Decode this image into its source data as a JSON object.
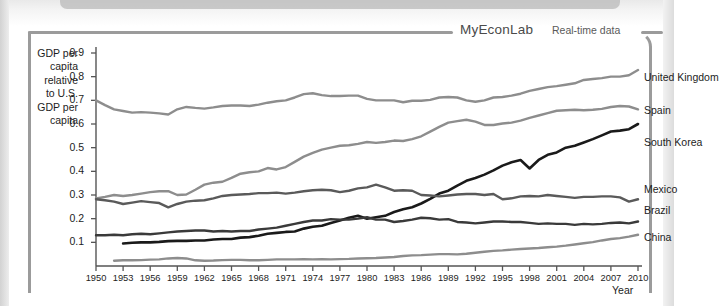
{
  "banner": {
    "brand": "MyEconLab",
    "subtitle": "Real-time data"
  },
  "chart_data": {
    "type": "line",
    "title": "",
    "xlabel": "Year",
    "ylabel": "GDP per capita relative to U.S. GDP per capita",
    "ylabel_lines": [
      "GDP per",
      "capita",
      "relative",
      "to U.S.",
      "GDP per",
      "capita"
    ],
    "xlim": [
      1950,
      2010
    ],
    "ylim": [
      0,
      0.9
    ],
    "grid": false,
    "legend_position": "right-inline",
    "ytick_labels": [
      "0.9",
      "0.8",
      "0.7",
      "0.6",
      "0.5",
      "0.4",
      "0.3",
      "0.2",
      "0.1"
    ],
    "yticks": [
      0.9,
      0.8,
      0.7,
      0.6,
      0.5,
      0.4,
      0.3,
      0.2,
      0.1
    ],
    "xtick_labels": [
      "1950",
      "1953",
      "1956",
      "1959",
      "1962",
      "1965",
      "1968",
      "1971",
      "1974",
      "1977",
      "1980",
      "1983",
      "1986",
      "1989",
      "1992",
      "1995",
      "1998",
      "2001",
      "2004",
      "2007",
      "2010"
    ],
    "xticks": [
      1950,
      1953,
      1956,
      1959,
      1962,
      1965,
      1968,
      1971,
      1974,
      1977,
      1980,
      1983,
      1986,
      1989,
      1992,
      1995,
      1998,
      2001,
      2004,
      2007,
      2010
    ],
    "series": [
      {
        "name": "United Kingdom",
        "color": "#8d8d8d",
        "width": 2.4,
        "label_y": 0.795,
        "x": [
          1950,
          1951,
          1952,
          1953,
          1954,
          1955,
          1956,
          1957,
          1958,
          1959,
          1960,
          1961,
          1962,
          1963,
          1964,
          1965,
          1966,
          1967,
          1968,
          1969,
          1970,
          1971,
          1972,
          1973,
          1974,
          1975,
          1976,
          1977,
          1978,
          1979,
          1980,
          1981,
          1982,
          1983,
          1984,
          1985,
          1986,
          1987,
          1988,
          1989,
          1990,
          1991,
          1992,
          1993,
          1994,
          1995,
          1996,
          1997,
          1998,
          1999,
          2000,
          2001,
          2002,
          2003,
          2004,
          2005,
          2006,
          2007,
          2008,
          2009,
          2010
        ],
        "values": [
          0.7,
          0.68,
          0.662,
          0.655,
          0.648,
          0.65,
          0.648,
          0.645,
          0.64,
          0.662,
          0.672,
          0.668,
          0.665,
          0.67,
          0.676,
          0.678,
          0.678,
          0.676,
          0.682,
          0.69,
          0.696,
          0.7,
          0.712,
          0.726,
          0.73,
          0.722,
          0.718,
          0.718,
          0.72,
          0.72,
          0.706,
          0.7,
          0.7,
          0.7,
          0.692,
          0.698,
          0.698,
          0.702,
          0.712,
          0.714,
          0.712,
          0.7,
          0.694,
          0.7,
          0.712,
          0.714,
          0.72,
          0.728,
          0.74,
          0.748,
          0.756,
          0.76,
          0.766,
          0.772,
          0.786,
          0.79,
          0.794,
          0.8,
          0.8,
          0.806,
          0.828
        ]
      },
      {
        "name": "Spain",
        "color": "#8d8d8d",
        "width": 2.4,
        "label_y": 0.655,
        "x": [
          1950,
          1951,
          1952,
          1953,
          1954,
          1955,
          1956,
          1957,
          1958,
          1959,
          1960,
          1961,
          1962,
          1963,
          1964,
          1965,
          1966,
          1967,
          1968,
          1969,
          1970,
          1971,
          1972,
          1973,
          1974,
          1975,
          1976,
          1977,
          1978,
          1979,
          1980,
          1981,
          1982,
          1983,
          1984,
          1985,
          1986,
          1987,
          1988,
          1989,
          1990,
          1991,
          1992,
          1993,
          1994,
          1995,
          1996,
          1997,
          1998,
          1999,
          2000,
          2001,
          2002,
          2003,
          2004,
          2005,
          2006,
          2007,
          2008,
          2009,
          2010
        ],
        "values": [
          0.285,
          0.292,
          0.3,
          0.296,
          0.3,
          0.306,
          0.312,
          0.316,
          0.316,
          0.3,
          0.302,
          0.322,
          0.344,
          0.352,
          0.356,
          0.372,
          0.39,
          0.396,
          0.4,
          0.414,
          0.408,
          0.418,
          0.44,
          0.462,
          0.478,
          0.492,
          0.5,
          0.508,
          0.51,
          0.516,
          0.524,
          0.52,
          0.524,
          0.53,
          0.528,
          0.536,
          0.548,
          0.568,
          0.588,
          0.606,
          0.612,
          0.618,
          0.61,
          0.596,
          0.596,
          0.602,
          0.606,
          0.614,
          0.626,
          0.636,
          0.646,
          0.656,
          0.658,
          0.66,
          0.658,
          0.66,
          0.664,
          0.672,
          0.676,
          0.674,
          0.662
        ]
      },
      {
        "name": "South Korea",
        "color": "#1a1a1a",
        "width": 2.6,
        "label_y": 0.52,
        "x": [
          1953,
          1954,
          1955,
          1956,
          1957,
          1958,
          1959,
          1960,
          1961,
          1962,
          1963,
          1964,
          1965,
          1966,
          1967,
          1968,
          1969,
          1970,
          1971,
          1972,
          1973,
          1974,
          1975,
          1976,
          1977,
          1978,
          1979,
          1980,
          1981,
          1982,
          1983,
          1984,
          1985,
          1986,
          1987,
          1988,
          1989,
          1990,
          1991,
          1992,
          1993,
          1994,
          1995,
          1996,
          1997,
          1998,
          1999,
          2000,
          2001,
          2002,
          2003,
          2004,
          2005,
          2006,
          2007,
          2008,
          2009,
          2010
        ],
        "values": [
          0.095,
          0.098,
          0.1,
          0.1,
          0.102,
          0.105,
          0.106,
          0.106,
          0.108,
          0.108,
          0.112,
          0.114,
          0.114,
          0.12,
          0.122,
          0.128,
          0.136,
          0.14,
          0.144,
          0.146,
          0.158,
          0.166,
          0.17,
          0.182,
          0.192,
          0.204,
          0.212,
          0.2,
          0.206,
          0.212,
          0.228,
          0.24,
          0.248,
          0.264,
          0.284,
          0.306,
          0.318,
          0.34,
          0.36,
          0.372,
          0.386,
          0.404,
          0.424,
          0.438,
          0.448,
          0.412,
          0.448,
          0.47,
          0.48,
          0.5,
          0.508,
          0.522,
          0.536,
          0.552,
          0.568,
          0.572,
          0.578,
          0.6
        ]
      },
      {
        "name": "Mexico",
        "color": "#5a5a5a",
        "width": 2.4,
        "label_y": 0.32,
        "x": [
          1950,
          1951,
          1952,
          1953,
          1954,
          1955,
          1956,
          1957,
          1958,
          1959,
          1960,
          1961,
          1962,
          1963,
          1964,
          1965,
          1966,
          1967,
          1968,
          1969,
          1970,
          1971,
          1972,
          1973,
          1974,
          1975,
          1976,
          1977,
          1978,
          1979,
          1980,
          1981,
          1982,
          1983,
          1984,
          1985,
          1986,
          1987,
          1988,
          1989,
          1990,
          1991,
          1992,
          1993,
          1994,
          1995,
          1996,
          1997,
          1998,
          1999,
          2000,
          2001,
          2002,
          2003,
          2004,
          2005,
          2006,
          2007,
          2008,
          2009,
          2010
        ],
        "values": [
          0.282,
          0.278,
          0.272,
          0.262,
          0.268,
          0.274,
          0.27,
          0.266,
          0.248,
          0.262,
          0.272,
          0.276,
          0.278,
          0.286,
          0.296,
          0.3,
          0.302,
          0.304,
          0.308,
          0.308,
          0.31,
          0.306,
          0.31,
          0.316,
          0.32,
          0.322,
          0.32,
          0.312,
          0.318,
          0.328,
          0.332,
          0.344,
          0.332,
          0.318,
          0.32,
          0.318,
          0.3,
          0.298,
          0.294,
          0.298,
          0.302,
          0.304,
          0.304,
          0.3,
          0.304,
          0.282,
          0.286,
          0.294,
          0.296,
          0.294,
          0.3,
          0.296,
          0.292,
          0.288,
          0.292,
          0.292,
          0.294,
          0.294,
          0.29,
          0.272,
          0.282
        ]
      },
      {
        "name": "Brazil",
        "color": "#3a3a3a",
        "width": 2.4,
        "label_y": 0.232,
        "x": [
          1950,
          1951,
          1952,
          1953,
          1954,
          1955,
          1956,
          1957,
          1958,
          1959,
          1960,
          1961,
          1962,
          1963,
          1964,
          1965,
          1966,
          1967,
          1968,
          1969,
          1970,
          1971,
          1972,
          1973,
          1974,
          1975,
          1976,
          1977,
          1978,
          1979,
          1980,
          1981,
          1982,
          1983,
          1984,
          1985,
          1986,
          1987,
          1988,
          1989,
          1990,
          1991,
          1992,
          1993,
          1994,
          1995,
          1996,
          1997,
          1998,
          1999,
          2000,
          2001,
          2002,
          2003,
          2004,
          2005,
          2006,
          2007,
          2008,
          2009,
          2010
        ],
        "values": [
          0.13,
          0.13,
          0.132,
          0.13,
          0.134,
          0.136,
          0.134,
          0.138,
          0.142,
          0.146,
          0.148,
          0.15,
          0.15,
          0.146,
          0.148,
          0.146,
          0.148,
          0.148,
          0.154,
          0.158,
          0.162,
          0.17,
          0.178,
          0.186,
          0.192,
          0.192,
          0.198,
          0.196,
          0.196,
          0.2,
          0.206,
          0.196,
          0.196,
          0.186,
          0.19,
          0.196,
          0.204,
          0.202,
          0.196,
          0.198,
          0.186,
          0.184,
          0.18,
          0.184,
          0.188,
          0.188,
          0.186,
          0.186,
          0.182,
          0.178,
          0.18,
          0.178,
          0.178,
          0.174,
          0.178,
          0.176,
          0.178,
          0.182,
          0.184,
          0.18,
          0.188
        ]
      },
      {
        "name": "China",
        "color": "#8d8d8d",
        "width": 2.4,
        "label_y": 0.12,
        "x": [
          1952,
          1953,
          1954,
          1955,
          1956,
          1957,
          1958,
          1959,
          1960,
          1961,
          1962,
          1963,
          1964,
          1965,
          1966,
          1967,
          1968,
          1969,
          1970,
          1971,
          1972,
          1973,
          1974,
          1975,
          1976,
          1977,
          1978,
          1979,
          1980,
          1981,
          1982,
          1983,
          1984,
          1985,
          1986,
          1987,
          1988,
          1989,
          1990,
          1991,
          1992,
          1993,
          1994,
          1995,
          1996,
          1997,
          1998,
          1999,
          2000,
          2001,
          2002,
          2003,
          2004,
          2005,
          2006,
          2007,
          2008,
          2009,
          2010
        ],
        "values": [
          0.022,
          0.024,
          0.024,
          0.025,
          0.027,
          0.028,
          0.032,
          0.034,
          0.032,
          0.024,
          0.022,
          0.023,
          0.025,
          0.026,
          0.026,
          0.024,
          0.024,
          0.026,
          0.028,
          0.028,
          0.028,
          0.029,
          0.028,
          0.029,
          0.028,
          0.029,
          0.03,
          0.032,
          0.033,
          0.034,
          0.036,
          0.038,
          0.042,
          0.045,
          0.046,
          0.048,
          0.05,
          0.05,
          0.049,
          0.052,
          0.056,
          0.06,
          0.064,
          0.066,
          0.069,
          0.072,
          0.074,
          0.076,
          0.079,
          0.082,
          0.086,
          0.091,
          0.096,
          0.101,
          0.108,
          0.114,
          0.118,
          0.124,
          0.132
        ]
      }
    ]
  }
}
